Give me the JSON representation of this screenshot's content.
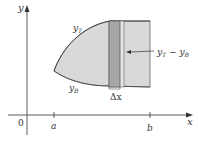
{
  "diagram": {
    "axes": {
      "x_label": "x",
      "y_label": "y",
      "origin_label": "0",
      "ticks": [
        {
          "label": "a"
        },
        {
          "label": "b"
        }
      ]
    },
    "curves": {
      "top": {
        "label_base": "y",
        "label_sub": "T"
      },
      "bottom": {
        "label_base": "y",
        "label_sub": "B"
      }
    },
    "strip": {
      "width_label": "Δx",
      "height_label_base1": "y",
      "height_label_sub1": "T",
      "height_label_op": " − ",
      "height_label_base2": "y",
      "height_label_sub2": "B"
    },
    "colors": {
      "region_fill": "#d9d9d9",
      "strip_fill": "#a6a6a6",
      "outline": "#555555",
      "axis": "#333333"
    }
  }
}
